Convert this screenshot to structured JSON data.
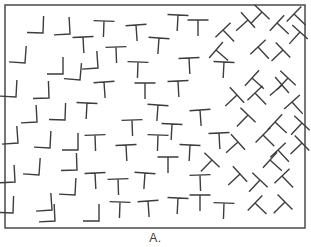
{
  "figure": {
    "label": "A.",
    "canvas": {
      "width": 311,
      "height": 247
    },
    "frame": {
      "x": 5,
      "y": 5,
      "width": 300,
      "height": 223,
      "border_color": "#4a4a4a",
      "border_width": 1.5,
      "background": "#ffffff"
    },
    "stroke": {
      "color": "#3d3d3d",
      "width": 1.4
    },
    "metrics": {
      "l_arm_up": 17,
      "l_arm_left": 16,
      "t_bar_half": 10.5,
      "t_stem": 16
    },
    "glyphs": [
      {
        "t": "L",
        "x": 43,
        "y": 33,
        "r": 2
      },
      {
        "t": "L",
        "x": 70,
        "y": 34,
        "r": -3
      },
      {
        "t": "L",
        "x": 25,
        "y": 63,
        "r": 4
      },
      {
        "t": "L",
        "x": 63,
        "y": 74,
        "r": 0
      },
      {
        "t": "L",
        "x": 98,
        "y": 68,
        "r": -4
      },
      {
        "t": "L",
        "x": 16,
        "y": 97,
        "r": 3
      },
      {
        "t": "L",
        "x": 49,
        "y": 98,
        "r": -2
      },
      {
        "t": "L",
        "x": 80,
        "y": 80,
        "r": 5
      },
      {
        "t": "L",
        "x": 37,
        "y": 122,
        "r": -3
      },
      {
        "t": "L",
        "x": 65,
        "y": 120,
        "r": 2
      },
      {
        "t": "L",
        "x": 18,
        "y": 143,
        "r": -4
      },
      {
        "t": "L",
        "x": 50,
        "y": 148,
        "r": 3
      },
      {
        "t": "L",
        "x": 78,
        "y": 150,
        "r": 0
      },
      {
        "t": "L",
        "x": 15,
        "y": 182,
        "r": -3
      },
      {
        "t": "L",
        "x": 39,
        "y": 175,
        "r": 4
      },
      {
        "t": "L",
        "x": 77,
        "y": 170,
        "r": -2
      },
      {
        "t": "L",
        "x": 13,
        "y": 213,
        "r": 2
      },
      {
        "t": "L",
        "x": 52,
        "y": 210,
        "r": -4
      },
      {
        "t": "L",
        "x": 75,
        "y": 195,
        "r": 3
      },
      {
        "t": "L",
        "x": 99,
        "y": 221,
        "r": 0
      },
      {
        "t": "L",
        "x": 55,
        "y": 221,
        "r": -3
      },
      {
        "t": "T",
        "x": 83,
        "y": 37,
        "r": -3
      },
      {
        "t": "T",
        "x": 104,
        "y": 21,
        "r": 2
      },
      {
        "t": "T",
        "x": 136,
        "y": 25,
        "r": -4
      },
      {
        "t": "T",
        "x": 178,
        "y": 15,
        "r": 3
      },
      {
        "t": "T",
        "x": 198,
        "y": 20,
        "r": 0
      },
      {
        "t": "T",
        "x": 116,
        "y": 47,
        "r": -2
      },
      {
        "t": "T",
        "x": 159,
        "y": 38,
        "r": 4
      },
      {
        "t": "T",
        "x": 189,
        "y": 58,
        "r": -3
      },
      {
        "t": "T",
        "x": 138,
        "y": 62,
        "r": 2
      },
      {
        "t": "T",
        "x": 104,
        "y": 82,
        "r": -4
      },
      {
        "t": "T",
        "x": 87,
        "y": 103,
        "r": 3
      },
      {
        "t": "T",
        "x": 95,
        "y": 135,
        "r": -2
      },
      {
        "t": "T",
        "x": 145,
        "y": 83,
        "r": 0
      },
      {
        "t": "T",
        "x": 178,
        "y": 81,
        "r": -3
      },
      {
        "t": "T",
        "x": 158,
        "y": 105,
        "r": 4
      },
      {
        "t": "T",
        "x": 132,
        "y": 120,
        "r": -2
      },
      {
        "t": "T",
        "x": 172,
        "y": 124,
        "r": 3
      },
      {
        "t": "T",
        "x": 200,
        "y": 110,
        "r": -4
      },
      {
        "t": "T",
        "x": 158,
        "y": 135,
        "r": 2
      },
      {
        "t": "T",
        "x": 126,
        "y": 145,
        "r": -3
      },
      {
        "t": "T",
        "x": 168,
        "y": 157,
        "r": 0
      },
      {
        "t": "T",
        "x": 190,
        "y": 145,
        "r": 3
      },
      {
        "t": "T",
        "x": 118,
        "y": 179,
        "r": -2
      },
      {
        "t": "T",
        "x": 145,
        "y": 173,
        "r": 4
      },
      {
        "t": "T",
        "x": 95,
        "y": 173,
        "r": -3
      },
      {
        "t": "T",
        "x": 120,
        "y": 202,
        "r": 2
      },
      {
        "t": "T",
        "x": 148,
        "y": 201,
        "r": -4
      },
      {
        "t": "T",
        "x": 178,
        "y": 198,
        "r": 3
      },
      {
        "t": "T",
        "x": 200,
        "y": 195,
        "r": 0
      },
      {
        "t": "T",
        "x": 200,
        "y": 175,
        "r": -2
      },
      {
        "t": "T",
        "x": 224,
        "y": 62,
        "r": 3
      },
      {
        "t": "T",
        "x": 219,
        "y": 133,
        "r": -3
      },
      {
        "t": "T",
        "x": 224,
        "y": 203,
        "r": 2
      },
      {
        "t": "TT",
        "x": 262,
        "y": 12,
        "r": 44
      },
      {
        "t": "TT",
        "x": 294,
        "y": 14,
        "r": -46
      },
      {
        "t": "TT",
        "x": 223,
        "y": 30,
        "r": -44
      },
      {
        "t": "TT",
        "x": 248,
        "y": 20,
        "r": 48
      },
      {
        "t": "TT",
        "x": 277,
        "y": 23,
        "r": -47
      },
      {
        "t": "TT",
        "x": 300,
        "y": 32,
        "r": 42
      },
      {
        "t": "TT",
        "x": 216,
        "y": 50,
        "r": -49
      },
      {
        "t": "TT",
        "x": 258,
        "y": 47,
        "r": -43
      },
      {
        "t": "TT",
        "x": 283,
        "y": 50,
        "r": 46
      },
      {
        "t": "TT",
        "x": 252,
        "y": 78,
        "r": -48
      },
      {
        "t": "TT",
        "x": 288,
        "y": 78,
        "r": 43
      },
      {
        "t": "TT",
        "x": 237,
        "y": 95,
        "r": 47
      },
      {
        "t": "TT",
        "x": 255,
        "y": 93,
        "r": -44
      },
      {
        "t": "TT",
        "x": 282,
        "y": 85,
        "r": 49
      },
      {
        "t": "TT",
        "x": 292,
        "y": 102,
        "r": -42
      },
      {
        "t": "TT",
        "x": 248,
        "y": 115,
        "r": 44
      },
      {
        "t": "TT",
        "x": 275,
        "y": 122,
        "r": -47
      },
      {
        "t": "TT",
        "x": 302,
        "y": 123,
        "r": 43
      },
      {
        "t": "TT",
        "x": 238,
        "y": 142,
        "r": 48
      },
      {
        "t": "TT",
        "x": 263,
        "y": 135,
        "r": -45
      },
      {
        "t": "TT",
        "x": 278,
        "y": 150,
        "r": -43
      },
      {
        "t": "TT",
        "x": 302,
        "y": 143,
        "r": 46
      },
      {
        "t": "TT",
        "x": 212,
        "y": 160,
        "r": 44
      },
      {
        "t": "TT",
        "x": 270,
        "y": 160,
        "r": -48
      },
      {
        "t": "TT",
        "x": 240,
        "y": 174,
        "r": 47
      },
      {
        "t": "TT",
        "x": 260,
        "y": 180,
        "r": 43
      },
      {
        "t": "TT",
        "x": 282,
        "y": 176,
        "r": -44
      },
      {
        "t": "TT",
        "x": 255,
        "y": 203,
        "r": -46
      },
      {
        "t": "TT",
        "x": 285,
        "y": 202,
        "r": 45
      }
    ]
  }
}
